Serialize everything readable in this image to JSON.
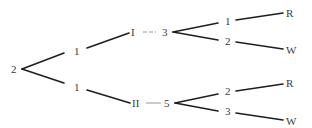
{
  "diagram": {
    "type": "tree",
    "colors": {
      "edge": "#1e1e1e",
      "label": "#3a3a3a",
      "dash": "#8a8a8a",
      "background": "#ffffff"
    },
    "root": {
      "label": "2"
    },
    "level1": [
      {
        "label": "1"
      },
      {
        "label": "1"
      }
    ],
    "level2": [
      {
        "label": "I",
        "connector": "--",
        "value": "3"
      },
      {
        "label": "II",
        "connector": "--",
        "value": "5"
      }
    ],
    "level3": [
      {
        "label": "1",
        "leaf": "R"
      },
      {
        "label": "2",
        "leaf": "W"
      },
      {
        "label": "2",
        "leaf": "R"
      },
      {
        "label": "3",
        "leaf": "W"
      }
    ]
  }
}
